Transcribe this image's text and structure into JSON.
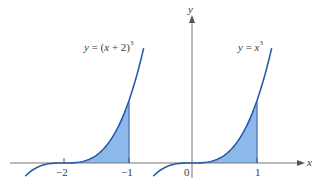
{
  "figure": {
    "axes": {
      "x_label": "x",
      "y_label": "y"
    },
    "ticks": [
      {
        "value": -2,
        "label": "−2"
      },
      {
        "value": -1,
        "label": "−1"
      },
      {
        "value": 0,
        "label": "0"
      },
      {
        "value": 1,
        "label": "1"
      }
    ],
    "curves": [
      {
        "name": "shifted-cube",
        "label_prefix": "y = (",
        "label_var": "x",
        "label_mid": " + 2)",
        "label_exp": "3",
        "shaded_from": -2,
        "shaded_to": -1
      },
      {
        "name": "cube",
        "label_prefix": "y = ",
        "label_var": "x",
        "label_exp": "3",
        "shaded_from": 0,
        "shaded_to": 1
      }
    ],
    "colors": {
      "curve": "#2a5caa",
      "fill": "#8db8ea",
      "axis": "#777777",
      "text": "#3a3a3a"
    }
  }
}
